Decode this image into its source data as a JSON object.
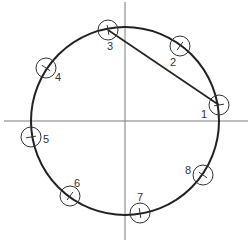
{
  "diagram": {
    "type": "circle-with-numbered-points",
    "axes": {
      "horizontal": {
        "x1": 4,
        "y1": 121,
        "x2": 248,
        "y2": 121
      },
      "vertical": {
        "x1": 125,
        "y1": 2,
        "x2": 125,
        "y2": 240
      }
    },
    "circle": {
      "cx": 125,
      "cy": 121,
      "r": 94
    },
    "chord": {
      "from": "3",
      "to": "1"
    },
    "points": [
      {
        "id": "1",
        "label": "1",
        "x": 219,
        "y": 105,
        "lx": 201,
        "ly": 118
      },
      {
        "id": "2",
        "label": "2",
        "x": 180,
        "y": 46,
        "lx": 170,
        "ly": 66
      },
      {
        "id": "3",
        "label": "3",
        "x": 108,
        "y": 30,
        "lx": 107,
        "ly": 50
      },
      {
        "id": "4",
        "label": "4",
        "x": 46,
        "y": 68,
        "lx": 55,
        "ly": 81
      },
      {
        "id": "5",
        "label": "5",
        "x": 31,
        "y": 137,
        "lx": 43,
        "ly": 143
      },
      {
        "id": "6",
        "label": "6",
        "x": 70,
        "y": 196,
        "lx": 74,
        "ly": 187
      },
      {
        "id": "7",
        "label": "7",
        "x": 140,
        "y": 213,
        "lx": 137,
        "ly": 201
      },
      {
        "id": "8",
        "label": "8",
        "x": 203,
        "y": 175,
        "lx": 185,
        "ly": 174
      }
    ]
  },
  "colors": {
    "axis": "#7a7a7a",
    "circle": "#222222",
    "marker": "#333333",
    "background": "#ffffff"
  }
}
